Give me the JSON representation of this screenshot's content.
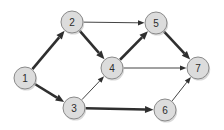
{
  "diagram": {
    "type": "node-link-diagram",
    "background_color": "#ffffff",
    "node_fill_color": "#dcdcdc",
    "node_stroke_color": "#8a8a8a",
    "edge_color": "#2f2f2f",
    "node_radius": 11,
    "nodes": [
      {
        "id": "1",
        "label": "1",
        "x": 25,
        "y": 78
      },
      {
        "id": "2",
        "label": "2",
        "x": 72,
        "y": 22
      },
      {
        "id": "3",
        "label": "3",
        "x": 74,
        "y": 108
      },
      {
        "id": "4",
        "label": "4",
        "x": 112,
        "y": 68
      },
      {
        "id": "5",
        "label": "5",
        "x": 156,
        "y": 23
      },
      {
        "id": "6",
        "label": "6",
        "x": 165,
        "y": 110
      },
      {
        "id": "7",
        "label": "7",
        "x": 198,
        "y": 68
      }
    ],
    "edges": [
      {
        "id": "e-1-2",
        "from": "1",
        "to": "2",
        "weight": "thick"
      },
      {
        "id": "e-1-3",
        "from": "1",
        "to": "3",
        "weight": "thick"
      },
      {
        "id": "e-2-5",
        "from": "2",
        "to": "5",
        "weight": "thin"
      },
      {
        "id": "e-2-4",
        "from": "2",
        "to": "4",
        "weight": "thick"
      },
      {
        "id": "e-3-4",
        "from": "3",
        "to": "4",
        "weight": "thin"
      },
      {
        "id": "e-3-6",
        "from": "3",
        "to": "6",
        "weight": "thick"
      },
      {
        "id": "e-4-5",
        "from": "4",
        "to": "5",
        "weight": "thick"
      },
      {
        "id": "e-4-7",
        "from": "4",
        "to": "7",
        "weight": "thin"
      },
      {
        "id": "e-5-7",
        "from": "5",
        "to": "7",
        "weight": "thick"
      },
      {
        "id": "e-6-7",
        "from": "6",
        "to": "7",
        "weight": "thin"
      }
    ]
  }
}
